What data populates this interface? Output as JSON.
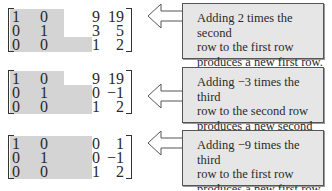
{
  "steps": [
    {
      "matrix": [
        [
          "1",
          "0",
          "9",
          "19"
        ],
        [
          "0",
          "1",
          "3",
          "5"
        ],
        [
          "0",
          "0",
          "1",
          "2"
        ]
      ],
      "note": [
        "Adding 2 times the second",
        "row to the first row",
        "produces a new first row."
      ]
    },
    {
      "matrix": [
        [
          "1",
          "0",
          "9",
          "19"
        ],
        [
          "0",
          "1",
          "0",
          "−1"
        ],
        [
          "0",
          "0",
          "1",
          "2"
        ]
      ],
      "note": [
        "Adding −3 times the third",
        "row to the second row",
        "produces a new second row."
      ]
    },
    {
      "matrix": [
        [
          "1",
          "0",
          "0",
          "1"
        ],
        [
          "0",
          "1",
          "0",
          "−1"
        ],
        [
          "0",
          "0",
          "1",
          "2"
        ]
      ],
      "note": [
        "Adding −9 times the third",
        "row to the first row",
        "produces a new first row."
      ]
    }
  ],
  "colors": {
    "shade": "#d4d4d4",
    "note_bg": "#e6e6e6",
    "border": "#555555"
  }
}
